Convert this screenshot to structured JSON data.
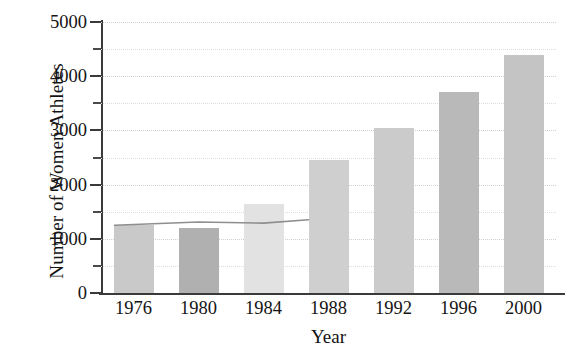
{
  "chart_data": {
    "type": "bar",
    "title": "",
    "xlabel": "Year",
    "ylabel": "Number of Women Athletes",
    "categories": [
      "1976",
      "1980",
      "1984",
      "1988",
      "1992",
      "1996",
      "2000"
    ],
    "values": [
      1250,
      1200,
      1650,
      2450,
      3050,
      3700,
      4400
    ],
    "ylim": [
      0,
      5000
    ],
    "ytick_major": [
      "0",
      "1000",
      "2000",
      "3000",
      "4000",
      "5000"
    ],
    "ytick_major_values": [
      0,
      1000,
      2000,
      3000,
      4000,
      5000
    ],
    "ytick_minor_values": [
      500,
      1500,
      2500,
      3500,
      4500
    ],
    "grid": true,
    "legend": "none",
    "bar_colors": [
      "#c9c9c9",
      "#b0b0b0",
      "#e2e2e2",
      "#cfcfcf",
      "#cbcbcb",
      "#b9b9b9",
      "#c4c4c4"
    ],
    "annotations": [
      {
        "name": "trend-line-overlay",
        "description": "faint gray line drawn across the first three bars",
        "color": "#8f8f8f",
        "points": [
          {
            "x": "1976",
            "y": 1250
          },
          {
            "x": "1980",
            "y": 1310
          },
          {
            "x": "1984",
            "y": 1290
          },
          {
            "x": "1984+",
            "y": 1350
          }
        ]
      }
    ]
  },
  "axis": {
    "y_title": "Number of Women Athletes",
    "x_title": "Year"
  }
}
